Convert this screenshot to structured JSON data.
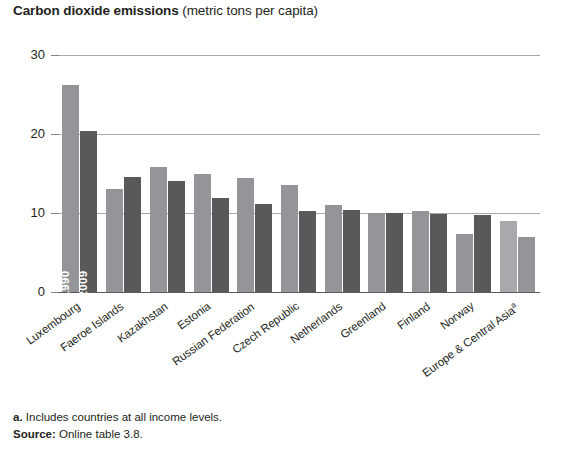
{
  "title": {
    "bold_part": "Carbon dioxide emissions",
    "rest_part": " (metric tons per capita)"
  },
  "footnotes": {
    "note_marker": "a.",
    "note_text": " Includes countries at all income levels.",
    "source_label": "Source:",
    "source_text": " Online table 3.8."
  },
  "series_labels": {
    "first": "1990",
    "second": "2009"
  },
  "colors": {
    "bar_1990": "#939598",
    "bar_2009": "#58595b",
    "bar_1990_alt": "#a7a9ac",
    "bar_2009_alt": "#939598",
    "gridline": "#a7a9ac",
    "axis": "#58595b",
    "text": "#231f20"
  },
  "chart_data": {
    "type": "bar",
    "title": "Carbon dioxide emissions (metric tons per capita)",
    "xlabel": "",
    "ylabel": "",
    "ylim": [
      0,
      30
    ],
    "yticks": [
      0,
      10,
      20,
      30
    ],
    "ytick_labels": [
      "0",
      "10",
      "20",
      "30"
    ],
    "grid": true,
    "legend_position": "in-bar",
    "categories": [
      "Luxembourg",
      "Faeroe Islands",
      "Kazakhstan",
      "Estonia",
      "Russian Federation",
      "Czech Republic",
      "Netherlands",
      "Greenland",
      "Finland",
      "Norway",
      "Europe & Central Asia"
    ],
    "category_notes": {
      "Europe & Central Asia": "a"
    },
    "series": [
      {
        "name": "1990",
        "values": [
          26.2,
          13.0,
          15.8,
          15.0,
          14.4,
          13.5,
          11.0,
          10.0,
          10.3,
          7.3,
          9.0
        ]
      },
      {
        "name": "2009",
        "values": [
          20.4,
          14.6,
          14.0,
          11.9,
          11.1,
          10.2,
          10.4,
          10.0,
          9.9,
          9.7,
          7.0
        ]
      }
    ]
  }
}
